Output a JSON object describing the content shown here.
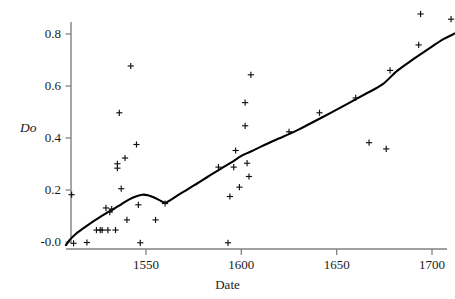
{
  "chart_data": {
    "type": "scatter",
    "title": "",
    "xlabel": "Date",
    "ylabel": "Do",
    "xlim": [
      1508,
      1712
    ],
    "ylim": [
      -0.02,
      0.88
    ],
    "grid": false,
    "legend": null,
    "xticks": [
      1550,
      1600,
      1650,
      1700
    ],
    "xtick_labels": [
      "1550",
      "1600",
      "1650",
      "1700"
    ],
    "yticks": [
      0.0,
      0.2,
      0.4,
      0.6,
      0.8
    ],
    "ytick_labels": [
      "-0.0",
      "0.2",
      "0.4",
      "0.6",
      "0.8"
    ],
    "marker": "plus",
    "marker_color": "#111111",
    "line_color": "#000000",
    "axis_color": "#808080",
    "points": [
      {
        "x": 1511,
        "y": 0.182
      },
      {
        "x": 1512,
        "y": -0.005
      },
      {
        "x": 1519,
        "y": -0.002
      },
      {
        "x": 1524,
        "y": 0.046
      },
      {
        "x": 1526,
        "y": 0.046
      },
      {
        "x": 1527,
        "y": 0.046
      },
      {
        "x": 1529,
        "y": 0.131
      },
      {
        "x": 1530,
        "y": 0.046
      },
      {
        "x": 1531,
        "y": 0.115
      },
      {
        "x": 1532,
        "y": 0.127
      },
      {
        "x": 1534,
        "y": 0.046
      },
      {
        "x": 1535,
        "y": 0.301
      },
      {
        "x": 1535,
        "y": 0.284
      },
      {
        "x": 1536,
        "y": 0.497
      },
      {
        "x": 1537,
        "y": 0.205
      },
      {
        "x": 1539,
        "y": 0.323
      },
      {
        "x": 1540,
        "y": 0.085
      },
      {
        "x": 1542,
        "y": 0.677
      },
      {
        "x": 1545,
        "y": 0.375
      },
      {
        "x": 1546,
        "y": 0.143
      },
      {
        "x": 1547,
        "y": -0.003
      },
      {
        "x": 1555,
        "y": 0.085
      },
      {
        "x": 1560,
        "y": 0.148
      },
      {
        "x": 1588,
        "y": 0.288
      },
      {
        "x": 1593,
        "y": -0.003
      },
      {
        "x": 1594,
        "y": 0.175
      },
      {
        "x": 1596,
        "y": 0.288
      },
      {
        "x": 1597,
        "y": 0.352
      },
      {
        "x": 1599,
        "y": 0.211
      },
      {
        "x": 1602,
        "y": 0.536
      },
      {
        "x": 1602,
        "y": 0.447
      },
      {
        "x": 1603,
        "y": 0.303
      },
      {
        "x": 1604,
        "y": 0.252
      },
      {
        "x": 1605,
        "y": 0.643
      },
      {
        "x": 1625,
        "y": 0.424
      },
      {
        "x": 1641,
        "y": 0.497
      },
      {
        "x": 1660,
        "y": 0.554
      },
      {
        "x": 1667,
        "y": 0.382
      },
      {
        "x": 1676,
        "y": 0.358
      },
      {
        "x": 1678,
        "y": 0.66
      },
      {
        "x": 1693,
        "y": 0.758
      },
      {
        "x": 1694,
        "y": 0.877
      },
      {
        "x": 1710,
        "y": 0.857
      }
    ],
    "smooth_line": [
      {
        "x": 1508,
        "y": -0.012
      },
      {
        "x": 1510,
        "y": 0.008
      },
      {
        "x": 1513,
        "y": 0.03
      },
      {
        "x": 1517,
        "y": 0.052
      },
      {
        "x": 1521,
        "y": 0.073
      },
      {
        "x": 1525,
        "y": 0.092
      },
      {
        "x": 1529,
        "y": 0.11
      },
      {
        "x": 1533,
        "y": 0.127
      },
      {
        "x": 1537,
        "y": 0.145
      },
      {
        "x": 1541,
        "y": 0.163
      },
      {
        "x": 1545,
        "y": 0.176
      },
      {
        "x": 1548,
        "y": 0.182
      },
      {
        "x": 1551,
        "y": 0.18
      },
      {
        "x": 1554,
        "y": 0.172
      },
      {
        "x": 1557,
        "y": 0.161
      },
      {
        "x": 1560,
        "y": 0.151
      },
      {
        "x": 1563,
        "y": 0.162
      },
      {
        "x": 1567,
        "y": 0.181
      },
      {
        "x": 1572,
        "y": 0.203
      },
      {
        "x": 1577,
        "y": 0.226
      },
      {
        "x": 1582,
        "y": 0.249
      },
      {
        "x": 1587,
        "y": 0.272
      },
      {
        "x": 1591,
        "y": 0.29
      },
      {
        "x": 1595,
        "y": 0.307
      },
      {
        "x": 1598,
        "y": 0.322
      },
      {
        "x": 1601,
        "y": 0.335
      },
      {
        "x": 1605,
        "y": 0.348
      },
      {
        "x": 1610,
        "y": 0.366
      },
      {
        "x": 1615,
        "y": 0.383
      },
      {
        "x": 1620,
        "y": 0.399
      },
      {
        "x": 1625,
        "y": 0.415
      },
      {
        "x": 1630,
        "y": 0.432
      },
      {
        "x": 1636,
        "y": 0.455
      },
      {
        "x": 1642,
        "y": 0.478
      },
      {
        "x": 1650,
        "y": 0.509
      },
      {
        "x": 1658,
        "y": 0.541
      },
      {
        "x": 1666,
        "y": 0.573
      },
      {
        "x": 1674,
        "y": 0.606
      },
      {
        "x": 1682,
        "y": 0.66
      },
      {
        "x": 1690,
        "y": 0.702
      },
      {
        "x": 1698,
        "y": 0.742
      },
      {
        "x": 1706,
        "y": 0.78
      },
      {
        "x": 1712,
        "y": 0.802
      }
    ]
  },
  "axes": {
    "y_title": "Do",
    "x_title": "Date"
  }
}
